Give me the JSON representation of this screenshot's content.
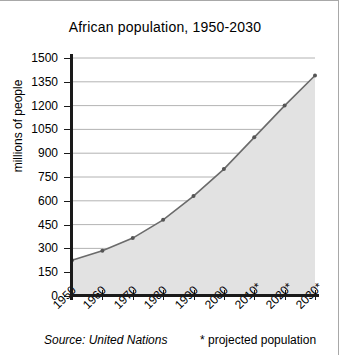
{
  "chart_data": {
    "type": "area",
    "title": "African population, 1950-2030",
    "xlabel": "",
    "ylabel": "millions of people",
    "categories": [
      "1950",
      "1960",
      "1970",
      "1980",
      "1990",
      "2000",
      "2010*",
      "2020*",
      "2030*"
    ],
    "values": [
      225,
      285,
      365,
      480,
      630,
      800,
      1000,
      1200,
      1390
    ],
    "ylim": [
      0,
      1500
    ],
    "ytick_labels": [
      "1500",
      "1350",
      "1200",
      "1050",
      "900",
      "750",
      "600",
      "450",
      "300",
      "150",
      "0"
    ],
    "ytick_values": [
      1500,
      1350,
      1200,
      1050,
      900,
      750,
      600,
      450,
      300,
      150,
      0
    ],
    "grid": true,
    "legend": "none",
    "series_name": "African population",
    "annotations": {
      "source": "Source: United Nations",
      "footnote": "* projected population"
    },
    "colors": {
      "line": "#6b6b6b",
      "fill": "#e2e2e2",
      "axis": "#1a1a1a",
      "grid": "#a0a0a0",
      "marker": "#555555",
      "text": "#000000",
      "frame": "#a8a8a8"
    }
  }
}
